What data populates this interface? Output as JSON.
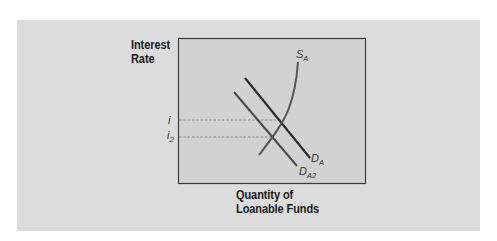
{
  "figure": {
    "y_axis_label_line1": "Interest",
    "y_axis_label_line2": "Rate",
    "x_axis_label_line1": "Quantity of",
    "x_axis_label_line2": "Loanable Funds",
    "curves": {
      "supply": {
        "label": "S",
        "subscript": "A"
      },
      "demand_original": {
        "label": "D",
        "subscript": "A"
      },
      "demand_shifted": {
        "label": "D",
        "subscript": "A2"
      }
    },
    "rate_levels": {
      "i": {
        "label": "i",
        "subscript": ""
      },
      "i2": {
        "label": "i",
        "subscript": "2"
      }
    },
    "colors": {
      "outer_panel": "#dcdcdc",
      "plot_area": "#d2d2d2",
      "frame": "#3a3a3a",
      "supply_curve": "#555555",
      "demand_curve": "#2a2a2a",
      "shifted_demand_curve": "#4a4a4a",
      "dashed_lines": "#777777"
    }
  }
}
